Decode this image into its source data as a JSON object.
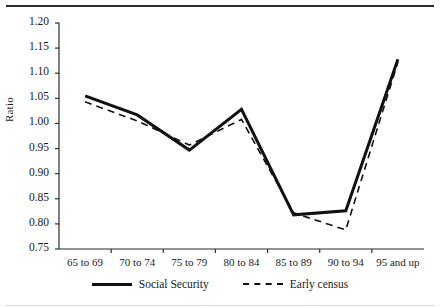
{
  "chart_data": {
    "type": "line",
    "title": "",
    "subtitle": "",
    "xlabel": "",
    "ylabel": "Ratio",
    "categories": [
      "65 to 69",
      "70 to 74",
      "75 to 79",
      "80 to 84",
      "85 to 89",
      "90 to 94",
      "95 and up"
    ],
    "ylim": [
      0.75,
      1.2
    ],
    "ytick_labels": [
      "1.20",
      "1.15",
      "1.10",
      "1.05",
      "1.00",
      "0.95",
      "0.90",
      "0.85",
      "0.80",
      "0.75"
    ],
    "ytick_values": [
      1.2,
      1.15,
      1.1,
      1.05,
      1.0,
      0.95,
      0.9,
      0.85,
      0.8,
      0.75
    ],
    "grid": false,
    "legend_position": "bottom",
    "series": [
      {
        "name": "Social Security",
        "style": "solid",
        "color": "#111111",
        "values": [
          1.055,
          1.017,
          0.947,
          1.028,
          0.818,
          0.826,
          1.128
        ]
      },
      {
        "name": "Early census",
        "style": "dashed",
        "color": "#111111",
        "values": [
          1.043,
          1.005,
          0.957,
          1.008,
          0.822,
          0.788,
          1.122
        ]
      }
    ]
  },
  "legend": {
    "items": [
      {
        "label": "Social Security",
        "style": "solid"
      },
      {
        "label": "Early census",
        "style": "dashed"
      }
    ]
  },
  "axes": {
    "y_title": "Ratio"
  }
}
